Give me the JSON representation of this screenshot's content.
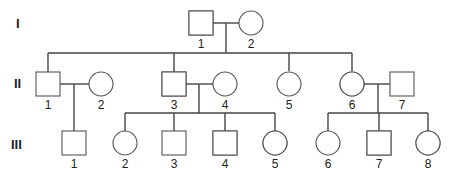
{
  "figure": {
    "type": "pedigree",
    "shading_color": "#9a9a9a",
    "line_color": "#444444",
    "legend_meaning": "half-shaded (lower-right) = carrier/partially affected"
  },
  "generations": [
    {
      "label": "I",
      "y": 23
    },
    {
      "label": "II",
      "y": 83
    },
    {
      "label": "III",
      "y": 144
    }
  ],
  "individuals": [
    {
      "id": "I-1",
      "gen": "I",
      "num": "1",
      "sex": "male",
      "status": "half-shaded",
      "cx": 201,
      "cy": 23
    },
    {
      "id": "I-2",
      "gen": "I",
      "num": "2",
      "sex": "female",
      "status": "unaffected",
      "cx": 251,
      "cy": 23
    },
    {
      "id": "II-1",
      "gen": "II",
      "num": "1",
      "sex": "male",
      "status": "unaffected",
      "cx": 48,
      "cy": 84
    },
    {
      "id": "II-2",
      "gen": "II",
      "num": "2",
      "sex": "female",
      "status": "unaffected",
      "cx": 101,
      "cy": 84
    },
    {
      "id": "II-3",
      "gen": "II",
      "num": "3",
      "sex": "male",
      "status": "half-shaded",
      "cx": 174,
      "cy": 84
    },
    {
      "id": "II-4",
      "gen": "II",
      "num": "4",
      "sex": "female",
      "status": "unaffected",
      "cx": 225,
      "cy": 84
    },
    {
      "id": "II-5",
      "gen": "II",
      "num": "5",
      "sex": "female",
      "status": "unaffected",
      "cx": 289,
      "cy": 84
    },
    {
      "id": "II-6",
      "gen": "II",
      "num": "6",
      "sex": "female",
      "status": "half-shaded",
      "cx": 352,
      "cy": 84
    },
    {
      "id": "II-7",
      "gen": "II",
      "num": "7",
      "sex": "male",
      "status": "unaffected",
      "cx": 402,
      "cy": 84
    },
    {
      "id": "III-1",
      "gen": "III",
      "num": "1",
      "sex": "male",
      "status": "unaffected",
      "cx": 74,
      "cy": 143
    },
    {
      "id": "III-2",
      "gen": "III",
      "num": "2",
      "sex": "female",
      "status": "unaffected",
      "cx": 125,
      "cy": 143
    },
    {
      "id": "III-3",
      "gen": "III",
      "num": "3",
      "sex": "male",
      "status": "unaffected",
      "cx": 174,
      "cy": 143
    },
    {
      "id": "III-4",
      "gen": "III",
      "num": "4",
      "sex": "male",
      "status": "half-shaded",
      "cx": 225,
      "cy": 143
    },
    {
      "id": "III-5",
      "gen": "III",
      "num": "5",
      "sex": "female",
      "status": "half-shaded",
      "cx": 275,
      "cy": 143
    },
    {
      "id": "III-6",
      "gen": "III",
      "num": "6",
      "sex": "female",
      "status": "unaffected",
      "cx": 328,
      "cy": 143
    },
    {
      "id": "III-7",
      "gen": "III",
      "num": "7",
      "sex": "male",
      "status": "half-shaded",
      "cx": 379,
      "cy": 143
    },
    {
      "id": "III-8",
      "gen": "III",
      "num": "8",
      "sex": "female",
      "status": "half-shaded",
      "cx": 428,
      "cy": 143
    }
  ],
  "unions": [
    {
      "partners": [
        "I-1",
        "I-2"
      ],
      "children": [
        "II-1",
        "II-3",
        "II-5",
        "II-6"
      ]
    },
    {
      "partners": [
        "II-1",
        "II-2"
      ],
      "children": [
        "III-1"
      ]
    },
    {
      "partners": [
        "II-3",
        "II-4"
      ],
      "children": [
        "III-2",
        "III-3",
        "III-4",
        "III-5"
      ]
    },
    {
      "partners": [
        "II-6",
        "II-7"
      ],
      "children": [
        "III-6",
        "III-7",
        "III-8"
      ]
    }
  ]
}
